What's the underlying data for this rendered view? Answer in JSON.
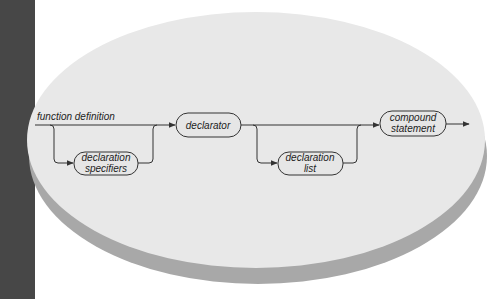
{
  "diagram": {
    "type": "syntax-diagram",
    "title": "function definition",
    "colors": {
      "background": "#ffffff",
      "left_strip": "#474747",
      "ellipse_face": "#e8e8e8",
      "ellipse_rim": "#a8a8a8",
      "line": "#333333",
      "node_fill": "#e6e6e6"
    },
    "nodes": [
      {
        "id": "declaration-specifiers",
        "lines": [
          "declaration",
          "specifiers"
        ],
        "optional": true
      },
      {
        "id": "declarator",
        "lines": [
          "declarator"
        ],
        "optional": false
      },
      {
        "id": "declaration-list",
        "lines": [
          "declaration",
          "list"
        ],
        "optional": true
      },
      {
        "id": "compound-statement",
        "lines": [
          "compound",
          "statement"
        ],
        "optional": false
      }
    ],
    "sequence": [
      "declaration-specifiers",
      "declarator",
      "declaration-list",
      "compound-statement"
    ]
  }
}
